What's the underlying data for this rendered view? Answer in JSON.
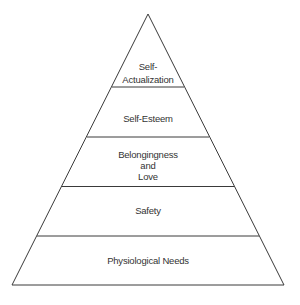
{
  "diagram": {
    "type": "pyramid",
    "title": "",
    "levels_top_to_bottom": [
      {
        "id": "self-actualization",
        "lines": [
          "Self-",
          "Actualization"
        ]
      },
      {
        "id": "self-esteem",
        "lines": [
          "Self-Esteem"
        ]
      },
      {
        "id": "belongingness-and-love",
        "lines": [
          "Belongingness",
          "and",
          "Love"
        ]
      },
      {
        "id": "safety",
        "lines": [
          "Safety"
        ]
      },
      {
        "id": "physiological-needs",
        "lines": [
          "Physiological Needs"
        ]
      }
    ]
  },
  "colors": {
    "line": "#3a3a3a",
    "text": "#333333",
    "background": "#ffffff"
  }
}
